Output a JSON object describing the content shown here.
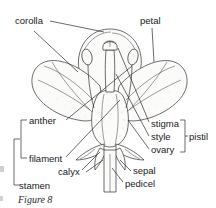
{
  "figure": {
    "caption": "Figure 8",
    "style": "pen-and-ink botanical line drawing with stipple shading"
  },
  "colors": {
    "background": "#ffffff",
    "ink": "#2f2f2f",
    "label_text": "#1a1a1a",
    "caption_text": "#2b2b2b",
    "shading_light": "#e9e9e7",
    "shading_mid": "#dedede",
    "shading_dark": "#cfcfcb"
  },
  "labels": [
    {
      "id": "corolla",
      "text": "corolla",
      "x": 15,
      "y": 24,
      "anchor": "start"
    },
    {
      "id": "petal",
      "text": "petal",
      "x": 140,
      "y": 24,
      "anchor": "start"
    },
    {
      "id": "anther",
      "text": "anther",
      "x": 29,
      "y": 124,
      "anchor": "start"
    },
    {
      "id": "filament",
      "text": "filament",
      "x": 29,
      "y": 162,
      "anchor": "start"
    },
    {
      "id": "stamen",
      "text": "stamen",
      "x": 19,
      "y": 189,
      "anchor": "start"
    },
    {
      "id": "calyx",
      "text": "calyx",
      "x": 58,
      "y": 175,
      "anchor": "start"
    },
    {
      "id": "stigma",
      "text": "stigma",
      "x": 151,
      "y": 127,
      "anchor": "start"
    },
    {
      "id": "style",
      "text": "style",
      "x": 151,
      "y": 140,
      "anchor": "start"
    },
    {
      "id": "ovary",
      "text": "ovary",
      "x": 151,
      "y": 153,
      "anchor": "start"
    },
    {
      "id": "pistil",
      "text": "pistil",
      "x": 189,
      "y": 140,
      "anchor": "start"
    },
    {
      "id": "sepal",
      "text": "sepal",
      "x": 133,
      "y": 174,
      "anchor": "start"
    },
    {
      "id": "pedicel",
      "text": "pedicel",
      "x": 125,
      "y": 187,
      "anchor": "start"
    }
  ],
  "brackets": [
    {
      "id": "stamen-inner",
      "parts": "anther + filament",
      "x": 21,
      "top": 120,
      "bottom": 158
    },
    {
      "id": "stamen-outer",
      "parts": "stamen group",
      "x": 14,
      "top": 139,
      "bottom": 185
    },
    {
      "id": "pistil",
      "parts": "stigma + style + ovary",
      "x": 184,
      "top": 120,
      "bottom": 152
    }
  ],
  "parts": [
    "corolla",
    "petal",
    "anther",
    "filament",
    "stamen",
    "calyx",
    "stigma",
    "style",
    "ovary",
    "pistil",
    "sepal",
    "pedicel"
  ]
}
